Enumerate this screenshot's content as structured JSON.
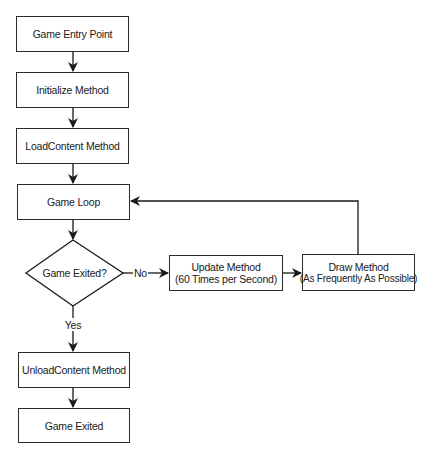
{
  "diagram": {
    "type": "flowchart",
    "nodes": {
      "entry": {
        "label": "Game Entry Point"
      },
      "initialize": {
        "label": "Initialize Method"
      },
      "load": {
        "label": "LoadContent Method"
      },
      "loop": {
        "label": "Game Loop"
      },
      "decision": {
        "label": "Game Exited?"
      },
      "update": {
        "line1": "Update Method",
        "line2": "(60 Times per Second)"
      },
      "draw": {
        "line1": "Draw Method",
        "line2": "(As Frequently As Possible)"
      },
      "unload": {
        "label": "UnloadContent Method"
      },
      "exited": {
        "label": "Game Exited"
      }
    },
    "edge_labels": {
      "no": "No",
      "yes": "Yes"
    },
    "edges": [
      [
        "entry",
        "initialize"
      ],
      [
        "initialize",
        "load"
      ],
      [
        "load",
        "loop"
      ],
      [
        "loop",
        "decision"
      ],
      [
        "decision",
        "update",
        "No"
      ],
      [
        "update",
        "draw"
      ],
      [
        "draw",
        "loop"
      ],
      [
        "decision",
        "unload",
        "Yes"
      ],
      [
        "unload",
        "exited"
      ]
    ]
  }
}
